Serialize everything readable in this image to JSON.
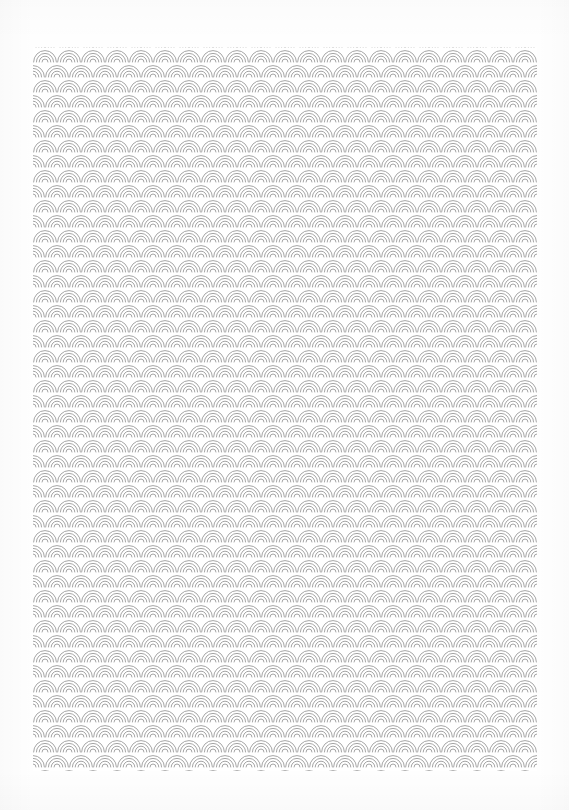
{
  "document": {
    "kind": "decorative-pattern-sheet",
    "motif_name": "seigaiha",
    "motif_label": "Seigaiha concentric wave scallop pattern",
    "alt_text": "A white sheet filled with a repeating gray seigaiha pattern of overlapping concentric semicircular arcs.",
    "canvas": {
      "width": 569,
      "height": 810,
      "background_color": "#fefefe"
    }
  },
  "pattern": {
    "block": {
      "left": 33,
      "top": 47,
      "width": 504,
      "height": 724,
      "background_color": "#ffffff"
    },
    "tile": {
      "width": 24,
      "height": 15,
      "row_offset": 12
    },
    "arc": {
      "ring_count": 4,
      "stroke_color": "#9a9a9a",
      "stroke_width": 0.9,
      "radii": [
        11.4,
        8.6,
        5.8,
        3.0
      ]
    },
    "colors": {
      "line": "#9a9a9a",
      "line_light": "#b4b4b4",
      "field": "#ffffff",
      "margin": "#fefefe"
    }
  }
}
